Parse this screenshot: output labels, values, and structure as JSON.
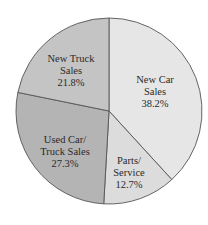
{
  "chart_data": {
    "type": "pie",
    "title": "",
    "start_angle_deg": -90,
    "direction": "clockwise",
    "slices": [
      {
        "name": "New Car Sales",
        "label_lines": [
          "New Car",
          "Sales",
          "38.2%"
        ],
        "value": 38.2,
        "color": "#e6e6e6",
        "label_pos": [
          155,
          83
        ]
      },
      {
        "name": "Parts/Service",
        "label_lines": [
          "Parts/",
          "Service",
          "12.7%"
        ],
        "value": 12.7,
        "color": "#dcdcdc",
        "label_pos": [
          129,
          164
        ]
      },
      {
        "name": "Used Car/Truck Sales",
        "label_lines": [
          "Used Car/",
          "Truck Sales",
          "27.3%"
        ],
        "value": 27.3,
        "color": "#b4b4b4",
        "label_pos": [
          65,
          143
        ]
      },
      {
        "name": "New Truck Sales",
        "label_lines": [
          "New Truck",
          "Sales",
          "21.8%"
        ],
        "value": 21.8,
        "color": "#c4c4c4",
        "label_pos": [
          71,
          62
        ]
      }
    ],
    "center": [
      109,
      111
    ],
    "radius": 93,
    "stroke": "#555555"
  }
}
